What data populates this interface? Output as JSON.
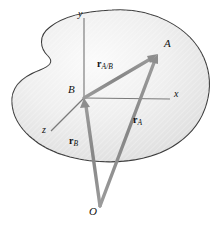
{
  "figure": {
    "type": "vector-diagram",
    "caption_title": "Relative position vectors of two points on a rigid body",
    "background_color": "#ffffff",
    "body_fill_light": "#f6f6f6",
    "body_fill_dark": "#dedede",
    "body_outline_color": "#3a3a3a",
    "vector_color": "#8d8d8d",
    "axis_color": "#7a7a7a",
    "label_color": "#111111"
  },
  "points": [
    {
      "id": "A",
      "label": "A",
      "x": 158,
      "y": 54,
      "label_x": 164,
      "label_y": 41,
      "description": "point A on the rigid body"
    },
    {
      "id": "B",
      "label": "B",
      "x": 84,
      "y": 98,
      "label_x": 69,
      "label_y": 86,
      "description": "point B, origin of the translating x-y-z frame"
    },
    {
      "id": "O",
      "label": "O",
      "x": 100,
      "y": 206,
      "label_x": 90,
      "label_y": 208,
      "description": "fixed origin O of the absolute reference frame"
    }
  ],
  "axes": [
    {
      "id": "y",
      "label": "y",
      "tip_x": 84,
      "tip_y": 16,
      "label_x": 79,
      "label_y": 12
    },
    {
      "id": "x",
      "label": "x",
      "tip_x": 172,
      "tip_y": 99,
      "label_x": 174,
      "label_y": 92
    },
    {
      "id": "z",
      "label": "z",
      "tip_x": 49,
      "tip_y": 132,
      "label_x": 43,
      "label_y": 128
    }
  ],
  "vectors": [
    {
      "id": "r_A_over_B",
      "symbol": "r",
      "subscript": "A/B",
      "from": "B",
      "to": "A",
      "label_x": 98,
      "label_y": 64,
      "description": "relative position vector of A with respect to B"
    },
    {
      "id": "r_A",
      "symbol": "r",
      "subscript": "A",
      "from": "O",
      "to": "A",
      "label_x": 134,
      "label_y": 120,
      "description": "absolute position vector of A measured from O"
    },
    {
      "id": "r_B",
      "symbol": "r",
      "subscript": "B",
      "from": "O",
      "to": "B",
      "label_x": 70,
      "label_y": 141,
      "description": "absolute position vector of B measured from O"
    }
  ]
}
